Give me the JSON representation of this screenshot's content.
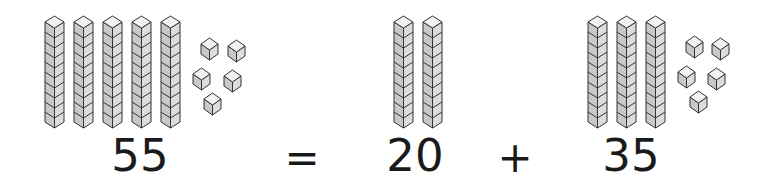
{
  "equation": {
    "total": "55",
    "equals": "=",
    "addend1": "20",
    "plus": "+",
    "addend2": "35"
  },
  "groups": [
    {
      "name": "fifty-five",
      "tens": 5,
      "ones": 5
    },
    {
      "name": "twenty",
      "tens": 2,
      "ones": 0
    },
    {
      "name": "thirty-five",
      "tens": 3,
      "ones": 5
    }
  ],
  "colors": {
    "cube_top": "#f2f2f2",
    "cube_left": "#c8c8c8",
    "cube_right": "#dcdcdc",
    "outline": "#333333",
    "text": "#1a1a1a"
  }
}
